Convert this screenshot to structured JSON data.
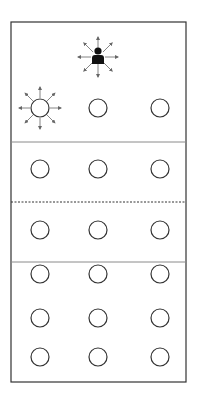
{
  "diagram": {
    "title": "",
    "colors": {
      "background": "#ffffff",
      "stroke": "#333333",
      "divider": "#8a8a8a",
      "arrow": "#666666",
      "person": "#111111"
    },
    "frame": {
      "x": 11,
      "y": 22,
      "width": 175,
      "height": 360
    },
    "dividers": [
      {
        "y": 142,
        "style": "solid"
      },
      {
        "y": 202,
        "style": "dashed"
      },
      {
        "y": 262,
        "style": "solid"
      }
    ],
    "columns_x": [
      40,
      98,
      160
    ],
    "rows_y": [
      108,
      169,
      230,
      274,
      318,
      357
    ],
    "circle_radius": 9,
    "source": {
      "icon": "person-icon",
      "x": 98,
      "y": 57,
      "radiating_arrows": 8
    },
    "highlighted_circle": {
      "row": 0,
      "col": 0,
      "radiating_arrows": 8
    }
  }
}
